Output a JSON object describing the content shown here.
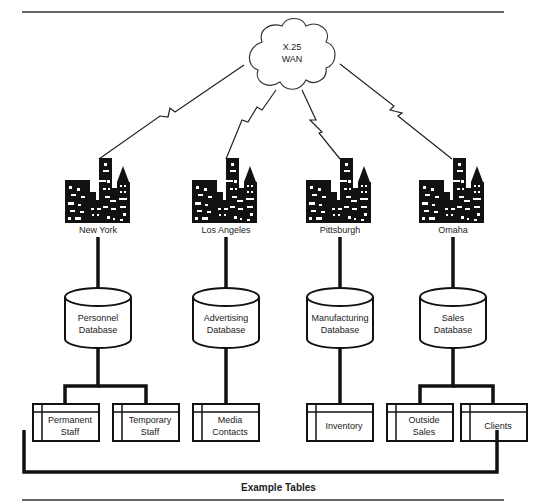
{
  "diagram": {
    "network": {
      "label_line1": "X.25",
      "label_line2": "WAN",
      "icon": "cloud-icon"
    },
    "sites": [
      {
        "city": "New York",
        "database_line1": "Personnel",
        "database_line2": "Database",
        "tables": [
          {
            "line1": "Permanent",
            "line2": "Staff"
          },
          {
            "line1": "Temporary",
            "line2": "Staff"
          }
        ]
      },
      {
        "city": "Los Angeles",
        "database_line1": "Advertising",
        "database_line2": "Database",
        "tables": [
          {
            "line1": "Media",
            "line2": "Contacts"
          }
        ]
      },
      {
        "city": "Pittsburgh",
        "database_line1": "Manufacturing",
        "database_line2": "Database",
        "tables": [
          {
            "line1": "Inventory",
            "line2": ""
          }
        ]
      },
      {
        "city": "Omaha",
        "database_line1": "Sales",
        "database_line2": "Database",
        "tables": [
          {
            "line1": "Outside",
            "line2": "Sales"
          },
          {
            "line1": "Clients",
            "line2": ""
          }
        ]
      }
    ],
    "caption": "Example Tables",
    "link_type": "lightning-bolt-wan-link",
    "colors": {
      "ink": "#111111",
      "background": "#ffffff"
    }
  }
}
